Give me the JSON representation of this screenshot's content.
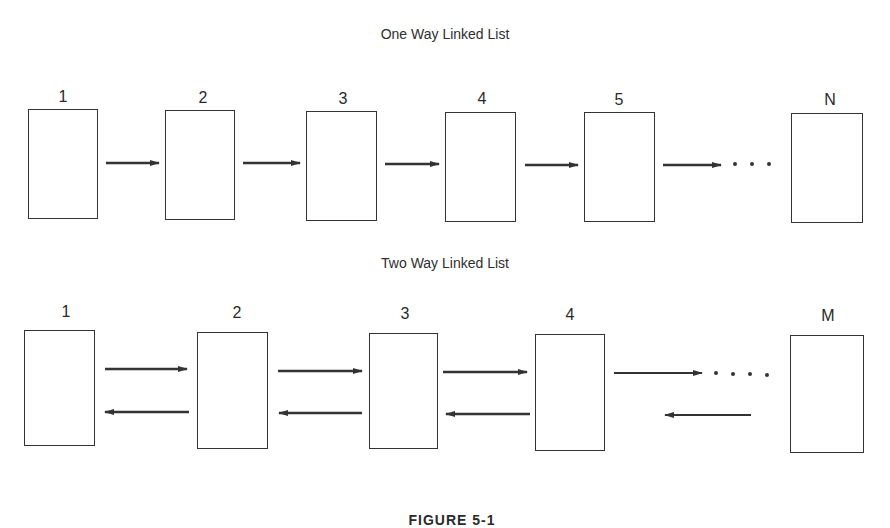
{
  "one_way": {
    "title": "One Way Linked List",
    "nodes": [
      {
        "label": "1",
        "x": 28,
        "y": 109,
        "w": 70,
        "h": 110
      },
      {
        "label": "2",
        "x": 165,
        "y": 110,
        "w": 70,
        "h": 110
      },
      {
        "label": "3",
        "x": 306,
        "y": 111,
        "w": 71,
        "h": 110
      },
      {
        "label": "4",
        "x": 445,
        "y": 112,
        "w": 71,
        "h": 110
      },
      {
        "label": "5",
        "x": 584,
        "y": 112,
        "w": 71,
        "h": 110
      },
      {
        "label": "N",
        "x": 791,
        "y": 113,
        "w": 72,
        "h": 110
      }
    ],
    "ellipsis": "• • •"
  },
  "two_way": {
    "title": "Two Way Linked List",
    "nodes": [
      {
        "label": "1",
        "x": 24,
        "y": 330,
        "w": 71,
        "h": 116
      },
      {
        "label": "2",
        "x": 197,
        "y": 332,
        "w": 71,
        "h": 117
      },
      {
        "label": "3",
        "x": 369,
        "y": 333,
        "w": 69,
        "h": 116
      },
      {
        "label": "4",
        "x": 535,
        "y": 334,
        "w": 70,
        "h": 117
      },
      {
        "label": "M",
        "x": 790,
        "y": 335,
        "w": 74,
        "h": 118
      }
    ],
    "ellipsis": "• • • •"
  },
  "caption": "FIGURE 5-1"
}
